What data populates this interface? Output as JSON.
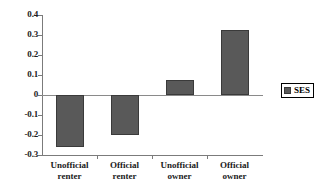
{
  "chart_data": {
    "type": "bar",
    "title": "",
    "subtitle": "",
    "xlabel": "",
    "ylabel": "",
    "categories": [
      "Unofficial renter",
      "Official renter",
      "Unofficial owner",
      "Official owner"
    ],
    "category_lines": [
      {
        "line1": "Unofficial",
        "line2": "renter"
      },
      {
        "line1": "Official",
        "line2": "renter"
      },
      {
        "line1": "Unofficial",
        "line2": "owner"
      },
      {
        "line1": "Official",
        "line2": "owner"
      }
    ],
    "series": [
      {
        "name": "SES",
        "values": [
          -0.26,
          -0.2,
          0.075,
          0.325
        ],
        "color": "#595959"
      }
    ],
    "ylim": [
      -0.3,
      0.4
    ],
    "ytick_step": 0.1,
    "ytick_labels": [
      "0.4",
      "0.3",
      "0.2",
      "0.1",
      "0",
      "-0.1",
      "-0.2",
      "-0.3"
    ],
    "ytick_values": [
      0.4,
      0.3,
      0.2,
      0.1,
      0,
      -0.1,
      -0.2,
      -0.3
    ],
    "grid": false,
    "zero_line": true,
    "legend": {
      "position": "right",
      "entries": [
        {
          "label": "SES",
          "color": "#595959"
        }
      ]
    },
    "axis_color": "#7b7b7b",
    "bar_border_color": "#3a3a3a",
    "text_color": "#1a1a1a"
  }
}
